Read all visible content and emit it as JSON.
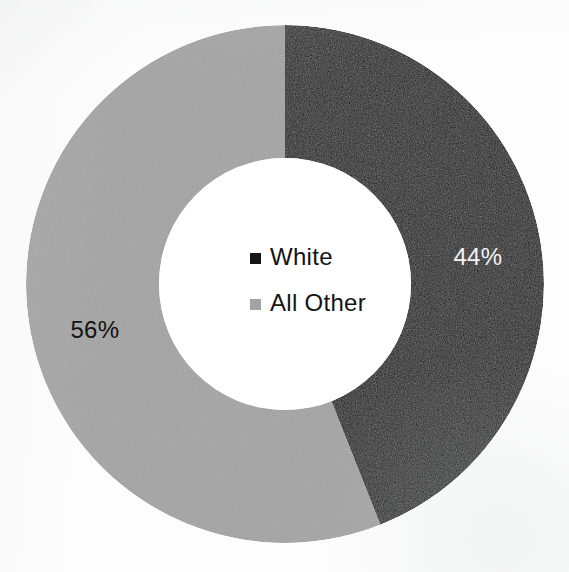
{
  "chart_data": {
    "type": "pie",
    "variant": "donut",
    "title": "",
    "subtitle": "",
    "xlabel": "",
    "ylabel": "",
    "grid": false,
    "legend_position": "center",
    "start_angle_deg": 0,
    "direction": "clockwise",
    "center": {
      "x": 285,
      "y": 284
    },
    "outer_radius": 259,
    "inner_radius": 126,
    "categories": [
      "White",
      "All Other"
    ],
    "values": [
      44,
      56
    ],
    "value_unit": "percent",
    "data_labels": [
      "44%",
      "56%"
    ],
    "colors": [
      "#0d0d0d",
      "#a3a3a3"
    ],
    "slices": [
      {
        "name": "White",
        "value": 44,
        "label": "44%",
        "color": "#0d0d0d",
        "label_color": "#f2f2f2",
        "start_deg": 0,
        "sweep_deg": 158.4
      },
      {
        "name": "All Other",
        "value": 56,
        "label": "56%",
        "color": "#a3a3a3",
        "label_color": "#111111",
        "start_deg": 158.4,
        "sweep_deg": 201.6
      }
    ]
  },
  "legend": {
    "items": [
      {
        "label": "White",
        "color": "#151515",
        "marker": "square-marker"
      },
      {
        "label": "All Other",
        "color": "#a3a3a3",
        "marker": "square-marker"
      }
    ]
  },
  "labels": {
    "white_pct": "44%",
    "all_other_pct": "56%"
  },
  "colors": {
    "slice_white": "#0d0d0d",
    "slice_all_other": "#a3a3a3",
    "background": "#fdfdfd",
    "hole": "#ffffff",
    "text_dark": "#141414",
    "text_light": "#f2f2f2"
  }
}
